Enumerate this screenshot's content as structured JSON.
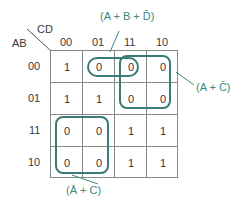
{
  "kmap": {
    "row_var": "AB",
    "col_var": "CD",
    "col_labels": [
      "00",
      "01",
      "11",
      "10"
    ],
    "row_labels": [
      "00",
      "01",
      "11",
      "10"
    ],
    "cells": [
      [
        "1",
        "0",
        "0",
        "0"
      ],
      [
        "1",
        "1",
        "0",
        "0"
      ],
      [
        "0",
        "0",
        "1",
        "1"
      ],
      [
        "0",
        "0",
        "1",
        "1"
      ]
    ]
  },
  "groups": [
    {
      "label": "(A + B + D̄)"
    },
    {
      "label": "(A + C̄)"
    },
    {
      "label": "(Ā + C)"
    }
  ],
  "colors": {
    "group_outline": "#3a7a78",
    "annotation_text": "#3a8a80",
    "grid_line": "#888888"
  }
}
